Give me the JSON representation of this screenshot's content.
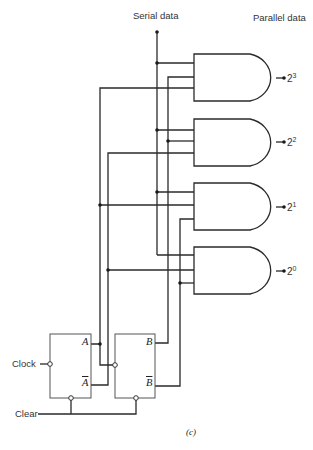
{
  "headers": {
    "serial": "Serial data",
    "parallel": "Parallel data"
  },
  "outputs": [
    {
      "base": "2",
      "exp": "3"
    },
    {
      "base": "2",
      "exp": "2"
    },
    {
      "base": "2",
      "exp": "1"
    },
    {
      "base": "2",
      "exp": "0"
    }
  ],
  "flipflops": {
    "a": {
      "q": "A",
      "qbar": "A"
    },
    "b": {
      "q": "B",
      "qbar": "B"
    }
  },
  "inputs": {
    "clock": "Clock",
    "clear": "Clear"
  },
  "caption": "(c)",
  "colors": {
    "line": "#2a2a2a",
    "background": "#ffffff"
  }
}
